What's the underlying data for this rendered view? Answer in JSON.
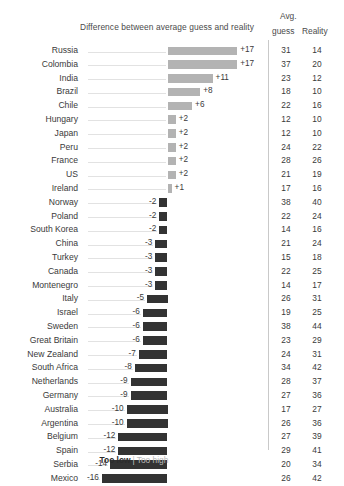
{
  "header": {
    "chart_title": "Difference between average guess and reality",
    "avg_label": "Avg.",
    "guess_label": "guess",
    "reality_label": "Reality"
  },
  "legend": {
    "too_low": "Too low",
    "separator": "|",
    "too_high": "Too high"
  },
  "colors": {
    "positive_bar": "#b3b3b3",
    "negative_bar": "#333333",
    "divider": "#c9c9c9",
    "leader_line": "#e2e2e2",
    "text": "#3a3a3a"
  },
  "chart_data": {
    "type": "bar",
    "title": "Difference between average guess and reality",
    "xlabel": "",
    "ylabel": "",
    "orientation": "horizontal",
    "grid": false,
    "legend_position": "bottom",
    "legend_entries": [
      "Too low",
      "Too high"
    ],
    "zero_line": true,
    "xlim": [
      -17,
      18
    ],
    "px_per_unit": 4.1,
    "categories": [
      "Russia",
      "Colombia",
      "India",
      "Brazil",
      "Chile",
      "Hungary",
      "Japan",
      "Peru",
      "France",
      "US",
      "Ireland",
      "Norway",
      "Poland",
      "South Korea",
      "China",
      "Turkey",
      "Canada",
      "Montenegro",
      "Italy",
      "Israel",
      "Sweden",
      "Great Britain",
      "New Zealand",
      "South Africa",
      "Netherlands",
      "Germany",
      "Australia",
      "Argentina",
      "Belgium",
      "Spain",
      "Serbia",
      "Mexico"
    ],
    "values": [
      17,
      17,
      11,
      8,
      6,
      2,
      2,
      2,
      2,
      2,
      1,
      -2,
      -2,
      -2,
      -3,
      -3,
      -3,
      -3,
      -5,
      -6,
      -6,
      -6,
      -7,
      -8,
      -9,
      -9,
      -10,
      -10,
      -12,
      -12,
      -14,
      -16
    ],
    "series": [
      {
        "name": "Difference",
        "values": [
          17,
          17,
          11,
          8,
          6,
          2,
          2,
          2,
          2,
          2,
          1,
          -2,
          -2,
          -2,
          -3,
          -3,
          -3,
          -3,
          -5,
          -6,
          -6,
          -6,
          -7,
          -8,
          -9,
          -9,
          -10,
          -10,
          -12,
          -12,
          -14,
          -16
        ]
      },
      {
        "name": "Avg. guess",
        "values": [
          31,
          37,
          23,
          18,
          22,
          12,
          12,
          24,
          28,
          21,
          17,
          38,
          22,
          14,
          21,
          15,
          22,
          14,
          26,
          19,
          38,
          23,
          24,
          34,
          28,
          27,
          17,
          26,
          27,
          29,
          20,
          26
        ]
      },
      {
        "name": "Reality",
        "values": [
          14,
          20,
          12,
          10,
          16,
          10,
          10,
          22,
          26,
          19,
          16,
          40,
          24,
          16,
          24,
          18,
          25,
          17,
          31,
          25,
          44,
          29,
          31,
          42,
          37,
          36,
          27,
          36,
          39,
          41,
          34,
          42
        ]
      }
    ],
    "rows": [
      {
        "country": "Russia",
        "diff": 17,
        "diff_label": "+17",
        "guess": 31,
        "reality": 14
      },
      {
        "country": "Colombia",
        "diff": 17,
        "diff_label": "+17",
        "guess": 37,
        "reality": 20
      },
      {
        "country": "India",
        "diff": 11,
        "diff_label": "+11",
        "guess": 23,
        "reality": 12
      },
      {
        "country": "Brazil",
        "diff": 8,
        "diff_label": "+8",
        "guess": 18,
        "reality": 10
      },
      {
        "country": "Chile",
        "diff": 6,
        "diff_label": "+6",
        "guess": 22,
        "reality": 16
      },
      {
        "country": "Hungary",
        "diff": 2,
        "diff_label": "+2",
        "guess": 12,
        "reality": 10
      },
      {
        "country": "Japan",
        "diff": 2,
        "diff_label": "+2",
        "guess": 12,
        "reality": 10
      },
      {
        "country": "Peru",
        "diff": 2,
        "diff_label": "+2",
        "guess": 24,
        "reality": 22
      },
      {
        "country": "France",
        "diff": 2,
        "diff_label": "+2",
        "guess": 28,
        "reality": 26
      },
      {
        "country": "US",
        "diff": 2,
        "diff_label": "+2",
        "guess": 21,
        "reality": 19
      },
      {
        "country": "Ireland",
        "diff": 1,
        "diff_label": "+1",
        "guess": 17,
        "reality": 16
      },
      {
        "country": "Norway",
        "diff": -2,
        "diff_label": "-2",
        "guess": 38,
        "reality": 40
      },
      {
        "country": "Poland",
        "diff": -2,
        "diff_label": "-2",
        "guess": 22,
        "reality": 24
      },
      {
        "country": "South Korea",
        "diff": -2,
        "diff_label": "-2",
        "guess": 14,
        "reality": 16
      },
      {
        "country": "China",
        "diff": -3,
        "diff_label": "-3",
        "guess": 21,
        "reality": 24
      },
      {
        "country": "Turkey",
        "diff": -3,
        "diff_label": "-3",
        "guess": 15,
        "reality": 18
      },
      {
        "country": "Canada",
        "diff": -3,
        "diff_label": "-3",
        "guess": 22,
        "reality": 25
      },
      {
        "country": "Montenegro",
        "diff": -3,
        "diff_label": "-3",
        "guess": 14,
        "reality": 17
      },
      {
        "country": "Italy",
        "diff": -5,
        "diff_label": "-5",
        "guess": 26,
        "reality": 31
      },
      {
        "country": "Israel",
        "diff": -6,
        "diff_label": "-6",
        "guess": 19,
        "reality": 25
      },
      {
        "country": "Sweden",
        "diff": -6,
        "diff_label": "-6",
        "guess": 38,
        "reality": 44
      },
      {
        "country": "Great Britain",
        "diff": -6,
        "diff_label": "-6",
        "guess": 23,
        "reality": 29
      },
      {
        "country": "New Zealand",
        "diff": -7,
        "diff_label": "-7",
        "guess": 24,
        "reality": 31
      },
      {
        "country": "South Africa",
        "diff": -8,
        "diff_label": "-8",
        "guess": 34,
        "reality": 42
      },
      {
        "country": "Netherlands",
        "diff": -9,
        "diff_label": "-9",
        "guess": 28,
        "reality": 37
      },
      {
        "country": "Germany",
        "diff": -9,
        "diff_label": "-9",
        "guess": 27,
        "reality": 36
      },
      {
        "country": "Australia",
        "diff": -10,
        "diff_label": "-10",
        "guess": 17,
        "reality": 27
      },
      {
        "country": "Argentina",
        "diff": -10,
        "diff_label": "-10",
        "guess": 26,
        "reality": 36
      },
      {
        "country": "Belgium",
        "diff": -12,
        "diff_label": "-12",
        "guess": 27,
        "reality": 39
      },
      {
        "country": "Spain",
        "diff": -12,
        "diff_label": "-12",
        "guess": 29,
        "reality": 41
      },
      {
        "country": "Serbia",
        "diff": -14,
        "diff_label": "-14",
        "guess": 20,
        "reality": 34
      },
      {
        "country": "Mexico",
        "diff": -16,
        "diff_label": "-16",
        "guess": 26,
        "reality": 42
      }
    ]
  }
}
